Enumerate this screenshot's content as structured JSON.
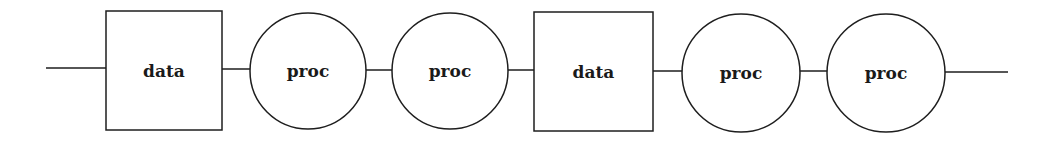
{
  "diagram": {
    "type": "pipeline",
    "baseline_y": 69,
    "nodes": [
      {
        "id": "n1",
        "shape": "rect",
        "label": "data",
        "x": 106,
        "y": 11,
        "w": 116,
        "h": 119
      },
      {
        "id": "n2",
        "shape": "circle",
        "label": "proc",
        "cx": 308,
        "cy": 71,
        "r": 58
      },
      {
        "id": "n3",
        "shape": "circle",
        "label": "proc",
        "cx": 450,
        "cy": 71,
        "r": 58
      },
      {
        "id": "n4",
        "shape": "rect",
        "label": "data",
        "x": 534,
        "y": 12,
        "w": 119,
        "h": 119
      },
      {
        "id": "n5",
        "shape": "circle",
        "label": "proc",
        "cx": 741,
        "cy": 73,
        "r": 59
      },
      {
        "id": "n6",
        "shape": "circle",
        "label": "proc",
        "cx": 886,
        "cy": 73,
        "r": 59
      }
    ],
    "edges": [
      {
        "from": "start",
        "to": "n1",
        "x1": 46,
        "y1": 68,
        "x2": 106,
        "y2": 68
      },
      {
        "from": "n1",
        "to": "n2",
        "x1": 222,
        "y1": 69,
        "x2": 250,
        "y2": 69
      },
      {
        "from": "n2",
        "to": "n3",
        "x1": 366,
        "y1": 70,
        "x2": 392,
        "y2": 70
      },
      {
        "from": "n3",
        "to": "n4",
        "x1": 508,
        "y1": 70,
        "x2": 534,
        "y2": 70
      },
      {
        "from": "n4",
        "to": "n5",
        "x1": 653,
        "y1": 71,
        "x2": 682,
        "y2": 71
      },
      {
        "from": "n5",
        "to": "n6",
        "x1": 800,
        "y1": 71,
        "x2": 827,
        "y2": 71
      },
      {
        "from": "n6",
        "to": "end",
        "x1": 945,
        "y1": 72,
        "x2": 1008,
        "y2": 72
      }
    ]
  }
}
